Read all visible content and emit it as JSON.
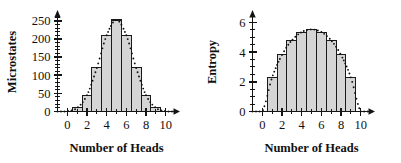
{
  "figure": {
    "panel_count": 2,
    "background": "#ffffff",
    "bar_fill": "#d5d5d5",
    "bar_stroke": "#1a1a1a",
    "axis_color": "#141414",
    "curve_color": "#111111"
  },
  "chart_data": [
    {
      "type": "bar",
      "title": "",
      "xlabel": "Number of Heads",
      "ylabel": "Microstates",
      "categories": [
        0,
        1,
        2,
        3,
        4,
        5,
        6,
        7,
        8,
        9,
        10
      ],
      "values": [
        1,
        10,
        45,
        120,
        210,
        252,
        210,
        120,
        45,
        10,
        1
      ],
      "xtick_labels": [
        "0",
        "2",
        "4",
        "6",
        "8",
        "10"
      ],
      "xtick_values": [
        0,
        2,
        4,
        6,
        8,
        10
      ],
      "ytick_labels": [
        "0",
        "50",
        "100",
        "150",
        "200",
        "250"
      ],
      "ytick_values": [
        0,
        50,
        100,
        150,
        200,
        250
      ],
      "yminor_step": 10,
      "xlim": [
        -1,
        11
      ],
      "ylim": [
        0,
        270
      ],
      "grid": false,
      "legend": "none",
      "overlay": {
        "type": "dotted-envelope",
        "description": "dotted curve tracing bar tops"
      }
    },
    {
      "type": "bar",
      "title": "",
      "xlabel": "Number of Heads",
      "ylabel": "Entropy",
      "categories": [
        0,
        1,
        2,
        3,
        4,
        5,
        6,
        7,
        8,
        9,
        10
      ],
      "values": [
        0,
        2.3,
        3.81,
        4.79,
        5.35,
        5.53,
        5.35,
        4.79,
        3.81,
        2.3,
        0
      ],
      "xtick_labels": [
        "0",
        "2",
        "4",
        "6",
        "8",
        "10"
      ],
      "xtick_values": [
        0,
        2,
        4,
        6,
        8,
        10
      ],
      "ytick_labels": [
        "0",
        "2",
        "4",
        "6"
      ],
      "ytick_values": [
        0,
        2,
        4,
        6
      ],
      "yminor_step": 0.5,
      "xlim": [
        -1,
        11
      ],
      "ylim": [
        0,
        6.6
      ],
      "grid": false,
      "legend": "none",
      "overlay": {
        "type": "dotted-envelope",
        "description": "dotted curve tracing bar tops"
      }
    }
  ]
}
